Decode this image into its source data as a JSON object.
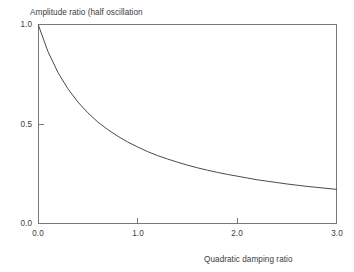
{
  "chart_data": {
    "type": "line",
    "title": "Amplitude ratio (half oscillation",
    "subtitle": "",
    "xlabel": "Quadratic damping ratio",
    "ylabel": "Amplitude ratio (half oscillation",
    "xlim": [
      0.0,
      3.0
    ],
    "ylim": [
      0.0,
      1.0
    ],
    "grid": false,
    "legend": null,
    "xticks": [
      0.0,
      1.0,
      2.0,
      3.0
    ],
    "xtick_labels": [
      "0.0",
      "1.0",
      "2.0",
      "3.0"
    ],
    "yticks": [
      0.0,
      0.5,
      1.0
    ],
    "ytick_labels": [
      "0.0",
      "0.5",
      "1.0"
    ],
    "series": [
      {
        "name": "amplitude ratio",
        "color": "#4a4a4a",
        "x": [
          0.0,
          0.1,
          0.2,
          0.3,
          0.4,
          0.5,
          0.6,
          0.7,
          0.8,
          0.9,
          1.0,
          1.1,
          1.2,
          1.3,
          1.4,
          1.5,
          1.6,
          1.7,
          1.8,
          1.9,
          2.0,
          2.1,
          2.2,
          2.3,
          2.4,
          2.5,
          2.6,
          2.7,
          2.8,
          2.9,
          3.0
        ],
        "values": [
          1.0,
          0.862,
          0.758,
          0.676,
          0.61,
          0.556,
          0.51,
          0.472,
          0.439,
          0.41,
          0.385,
          0.362,
          0.342,
          0.325,
          0.309,
          0.294,
          0.281,
          0.269,
          0.258,
          0.248,
          0.239,
          0.23,
          0.221,
          0.214,
          0.207,
          0.2,
          0.194,
          0.188,
          0.183,
          0.178,
          0.173
        ]
      }
    ]
  },
  "figure": {
    "background_color": "#ffffff",
    "frame_color": "#787878",
    "text_color": "#3c3c3c",
    "line_color": "#4a4a4a"
  }
}
